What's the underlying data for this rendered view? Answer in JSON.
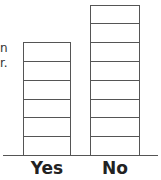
{
  "chart_data": {
    "type": "bar",
    "title": "",
    "xlabel": "",
    "ylabel": "",
    "categories": [
      "Yes",
      "No"
    ],
    "values": [
      6,
      8
    ],
    "unit_style": "stacked unit boxes",
    "ylim": [
      0,
      8
    ],
    "grid": false,
    "legend": null
  },
  "cropped_text": [
    "n",
    "r."
  ]
}
